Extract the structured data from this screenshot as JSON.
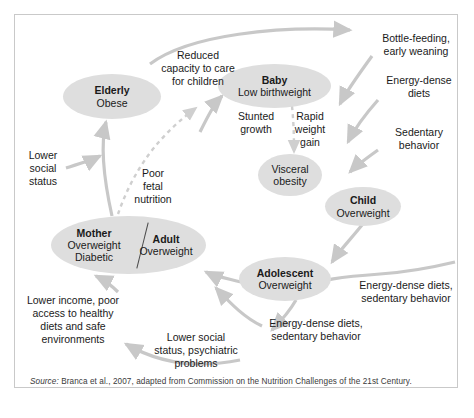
{
  "figure": {
    "type": "cycle-diagram",
    "title_visible": false,
    "source_prefix": "Source:",
    "source_text": " Branca et al., 2007, adapted from Commission on the Nutrition Challenges of the 21st Century.",
    "colors": {
      "node_fill": "#dedede",
      "arrow": "#c8c8c8",
      "border": "#c9c9c9",
      "text": "#1a1a1a",
      "background": "#ffffff"
    }
  },
  "nodes": [
    {
      "id": "elderly",
      "title": "Elderly",
      "subtitle": "Obese"
    },
    {
      "id": "baby",
      "title": "Baby",
      "subtitle": "Low birthweight"
    },
    {
      "id": "visceral",
      "title": "",
      "subtitle": "Visceral\nobesity"
    },
    {
      "id": "child",
      "title": "Child",
      "subtitle": "Overweight"
    },
    {
      "id": "adolescent",
      "title": "Adolescent",
      "subtitle": "Overweight"
    },
    {
      "id": "mother",
      "title": "Mother",
      "subtitle": "Overweight\nDiabetic"
    },
    {
      "id": "adult",
      "title": "Adult",
      "subtitle": "Overweight"
    }
  ],
  "labels": {
    "reduced_capacity": "Reduced\ncapacity to care\nfor children",
    "bottle_feeding": "Bottle-feeding,\nearly weaning",
    "energy_dense_diets": "Energy-dense\ndiets",
    "sedentary_behavior": "Sedentary\nbehavior",
    "lower_social_status": "Lower\nsocial\nstatus",
    "poor_fetal_nutrition": "Poor\nfetal\nnutrition",
    "stunted_growth": "Stunted\ngrowth",
    "rapid_weight_gain": "Rapid\nweight\ngain",
    "lower_income": "Lower income, poor\naccess to healthy\ndiets and safe\nenvironments",
    "lower_social_psych": "Lower social\nstatus, psychiatric\nproblems",
    "energy_dense_sedentary_right": "Energy-dense diets,\nsedentary behavior",
    "energy_dense_sedentary_bottom": "Energy-dense diets,\nsedentary behavior"
  }
}
